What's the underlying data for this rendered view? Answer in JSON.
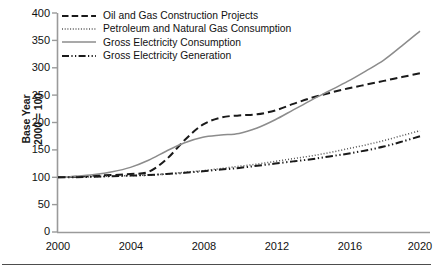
{
  "chart_data": {
    "type": "line",
    "title": "",
    "xlabel": "",
    "ylabel": "Base Year 2000 = 100",
    "ylabel_line1": "Base Year",
    "ylabel_line2": "2000 = 100",
    "xlim": [
      2000,
      2020
    ],
    "ylim": [
      0,
      400
    ],
    "yticks": [
      0,
      50,
      100,
      150,
      200,
      250,
      300,
      350,
      400
    ],
    "xticks": [
      2000,
      2004,
      2008,
      2012,
      2016,
      2020
    ],
    "grid": false,
    "legend_position": "top-left",
    "x": [
      2000,
      2001,
      2002,
      2003,
      2004,
      2005,
      2006,
      2007,
      2008,
      2009,
      2010,
      2011,
      2012,
      2013,
      2014,
      2015,
      2016,
      2017,
      2018,
      2019,
      2020
    ],
    "series": [
      {
        "name": "Oil and Gas Construction Projects",
        "style": "dashed",
        "color": "#1a1a1a",
        "values": [
          100,
          101,
          103,
          104,
          106,
          110,
          133,
          168,
          196,
          209,
          213,
          215,
          222,
          234,
          245,
          254,
          262,
          269,
          276,
          283,
          290
        ]
      },
      {
        "name": "Petroleum and Natural Gas Consumption",
        "style": "dotted",
        "color": "#555555",
        "values": [
          100,
          100,
          101,
          102,
          103,
          104,
          106,
          109,
          112,
          116,
          120,
          124,
          129,
          134,
          139,
          145,
          152,
          159,
          167,
          176,
          185
        ]
      },
      {
        "name": "Gross Electricity Consumption",
        "style": "solid",
        "color": "#8c8c8c",
        "values": [
          100,
          102,
          105,
          110,
          118,
          131,
          148,
          163,
          173,
          177,
          180,
          190,
          205,
          223,
          241,
          258,
          275,
          294,
          314,
          340,
          367
        ]
      },
      {
        "name": "Gross Electricity Generation",
        "style": "dashdot",
        "color": "#1a1a1a",
        "values": [
          100,
          100,
          101,
          102,
          103,
          104,
          106,
          108,
          111,
          114,
          117,
          121,
          125,
          129,
          133,
          138,
          143,
          149,
          156,
          165,
          175
        ]
      }
    ]
  },
  "legend": {
    "items": [
      {
        "label": "Oil and Gas Construction Projects"
      },
      {
        "label": "Petroleum and Natural Gas Consumption"
      },
      {
        "label": "Gross Electricity Consumption"
      },
      {
        "label": "Gross Electricity Generation"
      }
    ]
  },
  "axes": {
    "y_label_line1": "Base Year",
    "y_label_line2": "2000 = 100",
    "y_ticks": [
      "400",
      "350",
      "300",
      "250",
      "200",
      "150",
      "100",
      "50",
      "0"
    ],
    "x_ticks": [
      "2000",
      "2004",
      "2008",
      "2012",
      "2016",
      "2020"
    ]
  }
}
